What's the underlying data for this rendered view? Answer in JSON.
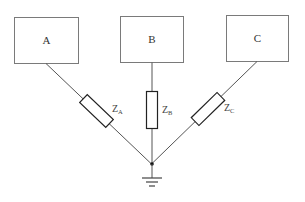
{
  "diagram": {
    "type": "star-connected impedance network with grounded neutral",
    "nodes": [
      {
        "id": "A",
        "label": "A"
      },
      {
        "id": "B",
        "label": "B"
      },
      {
        "id": "C",
        "label": "C"
      }
    ],
    "impedances": [
      {
        "id": "ZA",
        "symbol": "Z",
        "subscript": "A",
        "connects": [
          "A",
          "neutral"
        ]
      },
      {
        "id": "ZB",
        "symbol": "Z",
        "subscript": "B",
        "connects": [
          "B",
          "neutral"
        ]
      },
      {
        "id": "ZC",
        "symbol": "Z",
        "subscript": "C",
        "connects": [
          "C",
          "neutral"
        ]
      }
    ],
    "neutral": {
      "label": "",
      "grounded": true
    },
    "ground_icon": "ground-symbol",
    "colors": {
      "box_stroke": "#7a7a7a",
      "wire": "#555555",
      "resistor": "#222222",
      "text": "#333333"
    }
  }
}
